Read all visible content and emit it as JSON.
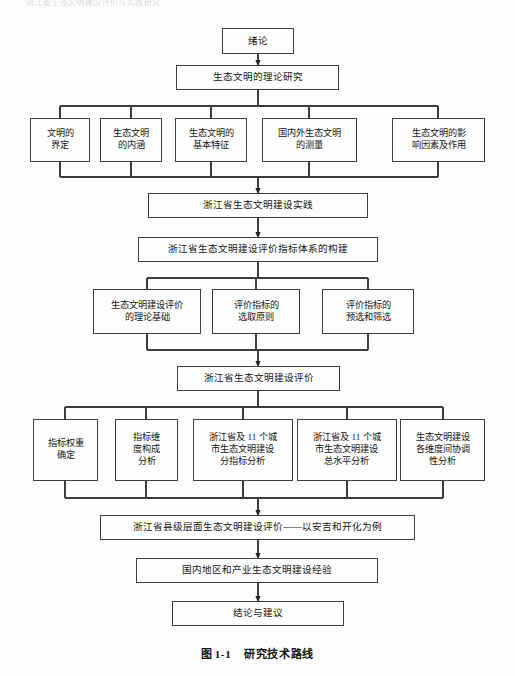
{
  "page": {
    "running_header": "浙江省生态文明建设评价与实践研究",
    "background_color": "#fdfdfd",
    "line_color": "#3d3d3d"
  },
  "caption": {
    "label": "图",
    "number": "1-1",
    "title": "研究技术路线"
  },
  "chart_data": {
    "type": "diagram",
    "diagram_kind": "flowchart",
    "title": "研究技术路线",
    "orientation": "top-to-bottom",
    "nodes": [
      {
        "id": "n1",
        "text": "绪论",
        "level": 0,
        "x": 222,
        "y": 28,
        "w": 72,
        "h": 26
      },
      {
        "id": "n2",
        "text": "生态文明的理论研究",
        "level": 1,
        "x": 176,
        "y": 65,
        "w": 163,
        "h": 25
      },
      {
        "id": "n3",
        "text": "文明的\n界定",
        "level": 2,
        "x": 30,
        "y": 118,
        "w": 60,
        "h": 44
      },
      {
        "id": "n4",
        "text": "生态文明\n的内涵",
        "level": 2,
        "x": 100,
        "y": 118,
        "w": 62,
        "h": 44
      },
      {
        "id": "n5",
        "text": "生态文明的\n基本特征",
        "level": 2,
        "x": 175,
        "y": 118,
        "w": 72,
        "h": 44
      },
      {
        "id": "n6",
        "text": "国内外生态文明\n的测量",
        "level": 2,
        "x": 262,
        "y": 118,
        "w": 95,
        "h": 44
      },
      {
        "id": "n7",
        "text": "生态文明的影\n响因素及作用",
        "level": 2,
        "x": 392,
        "y": 118,
        "w": 93,
        "h": 44
      },
      {
        "id": "n8",
        "text": "浙江省生态文明建设实践",
        "level": 3,
        "x": 148,
        "y": 193,
        "w": 220,
        "h": 25
      },
      {
        "id": "n9",
        "text": "浙江省生态文明建设评价指标体系的构建",
        "level": 4,
        "x": 138,
        "y": 237,
        "w": 240,
        "h": 25
      },
      {
        "id": "n10",
        "text": "生态文明建设评价\n的理论基础",
        "level": 5,
        "x": 93,
        "y": 289,
        "w": 108,
        "h": 45
      },
      {
        "id": "n11",
        "text": "评价指标的\n选取原则",
        "level": 5,
        "x": 212,
        "y": 289,
        "w": 88,
        "h": 45
      },
      {
        "id": "n12",
        "text": "评价指标的\n预选和筛选",
        "level": 5,
        "x": 322,
        "y": 289,
        "w": 92,
        "h": 45
      },
      {
        "id": "n13",
        "text": "浙江省生态文明建设评价",
        "level": 6,
        "x": 177,
        "y": 366,
        "w": 163,
        "h": 25
      },
      {
        "id": "n14",
        "text": "指标权重\n确定",
        "level": 7,
        "x": 33,
        "y": 419,
        "w": 65,
        "h": 62
      },
      {
        "id": "n15",
        "text": "指标维\n度构成\n分析",
        "level": 7,
        "x": 115,
        "y": 419,
        "w": 63,
        "h": 62
      },
      {
        "id": "n16",
        "text": "浙江省及 11 个城\n市生态文明建设\n分指标分析",
        "level": 7,
        "x": 193,
        "y": 419,
        "w": 100,
        "h": 62
      },
      {
        "id": "n17",
        "text": "浙江省及 11 个城\n市生态文明建设\n总水平分析",
        "level": 7,
        "x": 297,
        "y": 419,
        "w": 100,
        "h": 62
      },
      {
        "id": "n18",
        "text": "生态文明建设\n各维度间协调\n性分析",
        "level": 7,
        "x": 400,
        "y": 419,
        "w": 85,
        "h": 62
      },
      {
        "id": "n19",
        "text": "浙江省县级层面生态文明建设评价——以安吉和开化为例",
        "level": 8,
        "x": 100,
        "y": 515,
        "w": 315,
        "h": 25
      },
      {
        "id": "n20",
        "text": "国内地区和产业生态文明建设经验",
        "level": 9,
        "x": 136,
        "y": 558,
        "w": 242,
        "h": 25
      },
      {
        "id": "n21",
        "text": "结论与建议",
        "level": 10,
        "x": 172,
        "y": 601,
        "w": 172,
        "h": 25
      }
    ],
    "edges": [
      {
        "from": "n1",
        "to": "n2",
        "arrow": true
      },
      {
        "from": "n2",
        "to": "n3",
        "arrow": false
      },
      {
        "from": "n2",
        "to": "n4",
        "arrow": false
      },
      {
        "from": "n2",
        "to": "n5",
        "arrow": false
      },
      {
        "from": "n2",
        "to": "n6",
        "arrow": false
      },
      {
        "from": "n2",
        "to": "n7",
        "arrow": false
      },
      {
        "from": "n3",
        "to": "n8",
        "arrow": true
      },
      {
        "from": "n4",
        "to": "n8",
        "arrow": true
      },
      {
        "from": "n5",
        "to": "n8",
        "arrow": true
      },
      {
        "from": "n6",
        "to": "n8",
        "arrow": true
      },
      {
        "from": "n7",
        "to": "n8",
        "arrow": true
      },
      {
        "from": "n8",
        "to": "n9",
        "arrow": true
      },
      {
        "from": "n9",
        "to": "n10",
        "arrow": false
      },
      {
        "from": "n9",
        "to": "n11",
        "arrow": false
      },
      {
        "from": "n9",
        "to": "n12",
        "arrow": false
      },
      {
        "from": "n10",
        "to": "n13",
        "arrow": true
      },
      {
        "from": "n11",
        "to": "n13",
        "arrow": true
      },
      {
        "from": "n12",
        "to": "n13",
        "arrow": true
      },
      {
        "from": "n13",
        "to": "n14",
        "arrow": false
      },
      {
        "from": "n13",
        "to": "n15",
        "arrow": false
      },
      {
        "from": "n13",
        "to": "n16",
        "arrow": false
      },
      {
        "from": "n13",
        "to": "n17",
        "arrow": false
      },
      {
        "from": "n13",
        "to": "n18",
        "arrow": false
      },
      {
        "from": "n14",
        "to": "n19",
        "arrow": true
      },
      {
        "from": "n15",
        "to": "n19",
        "arrow": true
      },
      {
        "from": "n16",
        "to": "n19",
        "arrow": true
      },
      {
        "from": "n17",
        "to": "n19",
        "arrow": true
      },
      {
        "from": "n18",
        "to": "n19",
        "arrow": true
      },
      {
        "from": "n19",
        "to": "n20",
        "arrow": true
      },
      {
        "from": "n20",
        "to": "n21",
        "arrow": true
      }
    ]
  }
}
